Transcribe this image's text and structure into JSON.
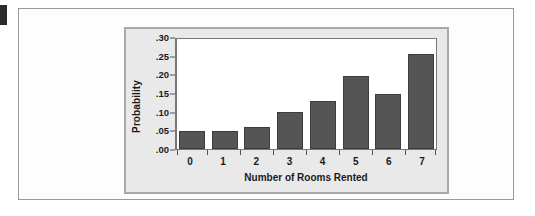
{
  "chart_data": {
    "type": "bar",
    "title": "",
    "xlabel": "Number of Rooms Rented",
    "ylabel": "Probability",
    "categories": [
      "0",
      "1",
      "2",
      "3",
      "4",
      "5",
      "6",
      "7"
    ],
    "values": [
      0.05,
      0.05,
      0.06,
      0.1,
      0.13,
      0.2,
      0.15,
      0.26
    ],
    "ylim": [
      0.0,
      0.3
    ],
    "ytick_labels": [
      ".00",
      ".05",
      ".10",
      ".15",
      ".20",
      ".25",
      ".30"
    ],
    "ytick_values": [
      0.0,
      0.05,
      0.1,
      0.15,
      0.2,
      0.25,
      0.3
    ],
    "grid": false,
    "legend": false,
    "legend_position": "none",
    "bar_color": "#555555",
    "plot_background": "#ffffff",
    "panel_background": "#e9e9e9",
    "axis_color": "#777777"
  }
}
